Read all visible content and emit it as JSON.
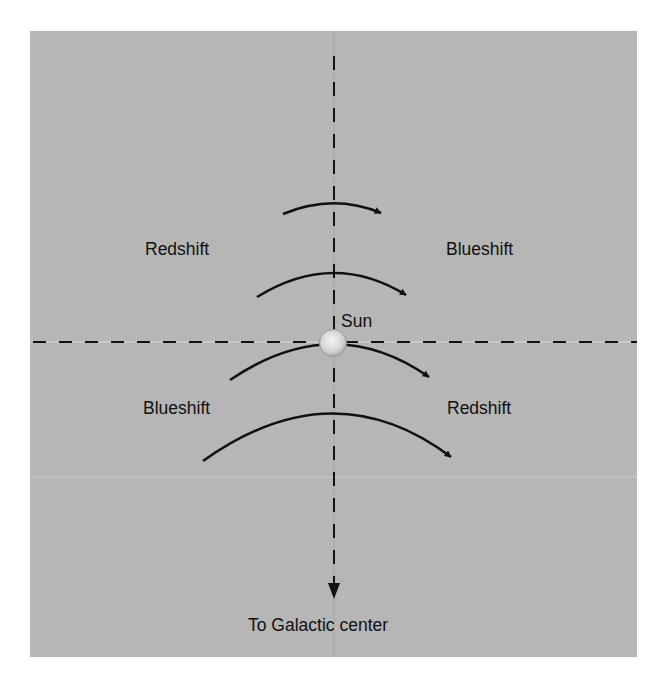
{
  "diagram": {
    "colors": {
      "background": "#ffffff",
      "panel": "#b6b6b6",
      "ink": "#111111",
      "sun_fill": "#d9d9d9"
    },
    "labels": {
      "upper_left": "Redshift",
      "upper_right": "Blueshift",
      "lower_left": "Blueshift",
      "lower_right": "Redshift",
      "sun": "Sun",
      "direction": "To Galactic center"
    },
    "arrows": [
      {
        "id": "arrow-1",
        "from": [
          283,
          214
        ],
        "apex": [
          333,
          203
        ],
        "to": [
          383,
          213
        ]
      },
      {
        "id": "arrow-2",
        "from": [
          257,
          297
        ],
        "apex": [
          333,
          273
        ],
        "to": [
          408,
          295
        ]
      },
      {
        "id": "arrow-3",
        "from": [
          230,
          380
        ],
        "apex": [
          333,
          344
        ],
        "to": [
          431,
          377
        ]
      },
      {
        "id": "arrow-4",
        "from": [
          203,
          461
        ],
        "apex": [
          333,
          414
        ],
        "to": [
          453,
          457
        ]
      }
    ],
    "axes": {
      "vertical_x": 334,
      "horizontal_y": 342
    }
  }
}
